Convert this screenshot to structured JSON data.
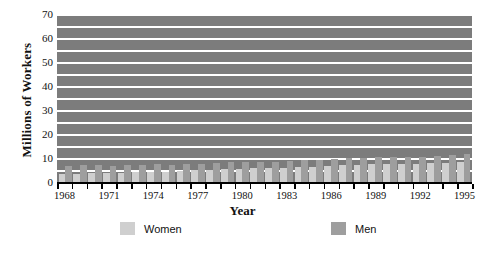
{
  "chart_data": {
    "type": "bar",
    "title": "",
    "xlabel": "Year",
    "ylabel": "Millions of Workers",
    "ylim": [
      0,
      70
    ],
    "ytick_step": 10,
    "gridline_step": 5,
    "grid": true,
    "legend_position": "bottom",
    "plot_background": "#7c7c7c",
    "gridline_color": "#ffffff",
    "categories": [
      "1968",
      "1969",
      "1970",
      "1971",
      "1972",
      "1973",
      "1974",
      "1975",
      "1976",
      "1977",
      "1978",
      "1979",
      "1980",
      "1981",
      "1982",
      "1983",
      "1984",
      "1985",
      "1986",
      "1987",
      "1988",
      "1989",
      "1990",
      "1991",
      "1992",
      "1993",
      "1994",
      "1995"
    ],
    "xtick_labels": [
      "1968",
      "1971",
      "1974",
      "1977",
      "1980",
      "1983",
      "1986",
      "1989",
      "1992",
      "1995"
    ],
    "yticks": [
      0,
      10,
      20,
      30,
      40,
      50,
      60,
      70
    ],
    "series": [
      {
        "name": "Women",
        "color": "#cfcfcf",
        "values": [
          3.3,
          3.5,
          3.6,
          3.6,
          3.8,
          4.0,
          4.2,
          4.3,
          4.5,
          4.8,
          5.1,
          5.4,
          5.6,
          5.7,
          5.8,
          5.9,
          6.2,
          6.4,
          6.6,
          6.9,
          7.1,
          7.3,
          7.5,
          7.5,
          7.6,
          7.8,
          8.1,
          8.4
        ]
      },
      {
        "name": "Men",
        "color": "#9e9e9e",
        "values": [
          6.8,
          6.9,
          6.9,
          6.8,
          7.0,
          7.2,
          7.3,
          7.2,
          7.4,
          7.7,
          8.1,
          8.4,
          8.5,
          8.5,
          8.4,
          8.6,
          9.0,
          9.2,
          9.5,
          9.8,
          10.1,
          10.4,
          10.6,
          10.5,
          10.6,
          10.9,
          11.3,
          11.7
        ]
      }
    ]
  },
  "legend": {
    "women_label": "Women",
    "men_label": "Men"
  },
  "axes": {
    "x_title": "Year",
    "y_title": "Millions of Workers"
  }
}
